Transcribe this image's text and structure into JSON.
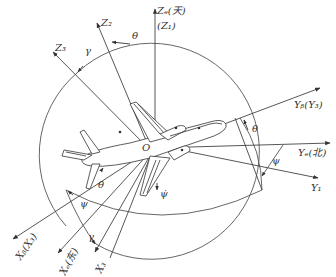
{
  "diagram": {
    "origin_label": "O",
    "axes": [
      {
        "id": "ze",
        "label": "Zₑ(天)",
        "sublabel": "(Z₁)"
      },
      {
        "id": "z2",
        "label": "Z₂"
      },
      {
        "id": "z3",
        "label": "Z₃"
      },
      {
        "id": "yb",
        "label": "Yᵦ(Y₃)"
      },
      {
        "id": "ye",
        "label": "Yₑ(北)"
      },
      {
        "id": "y1",
        "label": "Y₁"
      },
      {
        "id": "xb",
        "label": "Xᵦ(X₃)"
      },
      {
        "id": "xe",
        "label": "Xₑ(东)"
      },
      {
        "id": "x3",
        "label": "X₃"
      }
    ],
    "angles": {
      "theta_top": "θ",
      "gamma_top": "γ",
      "theta_right": "θ",
      "psi_right": "ψ",
      "theta_dot": "θ̇",
      "psi_dot": "ψ̇",
      "psi_bottom": "ψ",
      "gamma_bottom": "γ"
    },
    "line_color": "#444444",
    "text_color": "#333333"
  }
}
